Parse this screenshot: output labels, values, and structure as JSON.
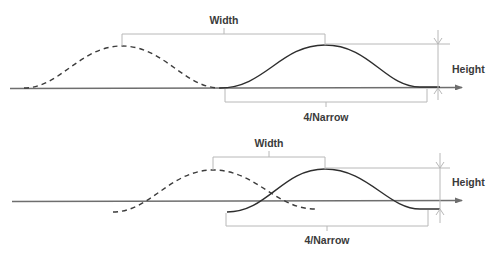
{
  "diagrams": [
    {
      "id": "top",
      "labels": {
        "width": "Width",
        "height": "Height",
        "narrow": "4/Narrow"
      },
      "curves": {
        "previous_pulse": "dashed",
        "current_pulse": "solid"
      }
    },
    {
      "id": "bottom",
      "labels": {
        "width": "Width",
        "height": "Height",
        "narrow": "4/Narrow"
      },
      "curves": {
        "previous_pulse": "dashed",
        "current_pulse": "solid"
      }
    }
  ],
  "colors": {
    "axis": "#6e6e6e",
    "guide": "#b8b8b8",
    "curve": "#2e2e2e",
    "text": "#3a3a3a"
  }
}
